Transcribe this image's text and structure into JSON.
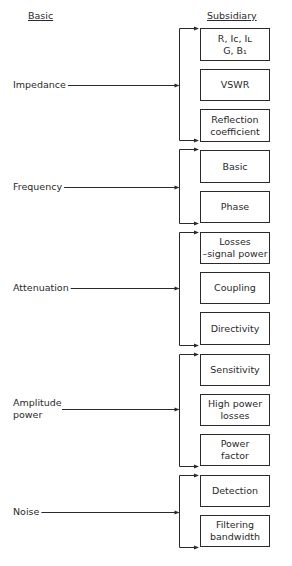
{
  "headings": {
    "left": "Basic",
    "right": "Subsidiary"
  },
  "groups": [
    {
      "label": "Impedance",
      "label_y": 79,
      "arrow_y": 85,
      "bracket_top": 28,
      "bracket_bottom": 140,
      "items": [
        {
          "text": "R, Iᴄ, Iʟ\nG, B₁",
          "top": 28,
          "height": 33
        },
        {
          "text": "VSWR",
          "top": 69,
          "height": 32
        },
        {
          "text": "Reflection\ncoefficient",
          "top": 109,
          "height": 33
        }
      ]
    },
    {
      "label": "Frequency",
      "label_y": 181,
      "arrow_y": 187,
      "bracket_top": 149,
      "bracket_bottom": 223,
      "items": [
        {
          "text": "Basic",
          "top": 150,
          "height": 33
        },
        {
          "text": "Phase",
          "top": 191,
          "height": 32
        }
      ]
    },
    {
      "label": "Attenuation",
      "label_y": 282,
      "arrow_y": 288,
      "bracket_top": 232,
      "bracket_bottom": 345,
      "items": [
        {
          "text": "Losses\n–signal power",
          "top": 232,
          "height": 32
        },
        {
          "text": "Coupling",
          "top": 272,
          "height": 32
        },
        {
          "text": "Directivity",
          "top": 312,
          "height": 33
        }
      ]
    },
    {
      "label": "Amplitude\npower",
      "label_y": 397,
      "arrow_y": 409,
      "bracket_top": 354,
      "bracket_bottom": 466,
      "items": [
        {
          "text": "Sensitivity",
          "top": 354,
          "height": 32
        },
        {
          "text": "High power\nlosses",
          "top": 394,
          "height": 32
        },
        {
          "text": "Power\nfactor",
          "top": 434,
          "height": 32
        }
      ]
    },
    {
      "label": "Noise",
      "label_y": 506,
      "arrow_y": 512,
      "bracket_top": 475,
      "bracket_bottom": 547,
      "items": [
        {
          "text": "Detection",
          "top": 475,
          "height": 32
        },
        {
          "text": "Filtering\nbandwidth",
          "top": 515,
          "height": 32
        }
      ]
    }
  ],
  "colors": {
    "line": "#2a2a2a",
    "background": "#ffffff"
  }
}
